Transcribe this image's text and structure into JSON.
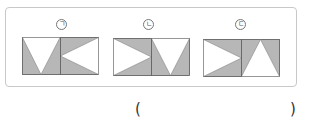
{
  "colors": {
    "shaded": "#b7b7b7",
    "unshaded": "#ffffff",
    "stroke": "#555555",
    "frame": "#c8c8c8"
  },
  "figures": [
    {
      "label": "ㄱ",
      "x": 22,
      "y": 37,
      "width": 76,
      "height": 37,
      "left_half": "white-triangle-pointing-down",
      "right_half": "white-triangle-pointing-left"
    },
    {
      "label": "ㄴ",
      "x": 113,
      "y": 38,
      "width": 76,
      "height": 37,
      "left_half": "white-triangle-pointing-right",
      "right_half": "white-triangle-pointing-down"
    },
    {
      "label": "ㄷ",
      "x": 203,
      "y": 39,
      "width": 76,
      "height": 37,
      "left_half": "white-triangle-pointing-right",
      "right_half": "white-triangle-pointing-up"
    }
  ],
  "answer": {
    "open": "(",
    "close": ")",
    "value": ""
  }
}
